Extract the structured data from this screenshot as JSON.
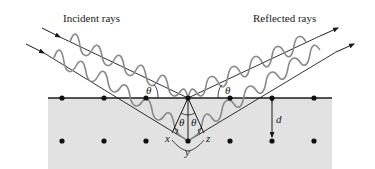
{
  "labels": {
    "incident": "Incident rays",
    "reflected": "Reflected rays",
    "theta_left": "θ",
    "theta_right": "θ",
    "theta_inner_left": "θ",
    "theta_inner_right": "θ",
    "point_x": "x",
    "point_y": "y",
    "point_z": "z",
    "spacing_d": "d"
  },
  "colors": {
    "crystal_fill": "#e2e2e2",
    "line": "#1a1a1a",
    "wave": "#8a8a8a",
    "dot": "#111111"
  },
  "lattice": {
    "top_row_y": 98,
    "bottom_row_y": 141,
    "columns_x": [
      62,
      104,
      146,
      188,
      230,
      272,
      314
    ]
  }
}
